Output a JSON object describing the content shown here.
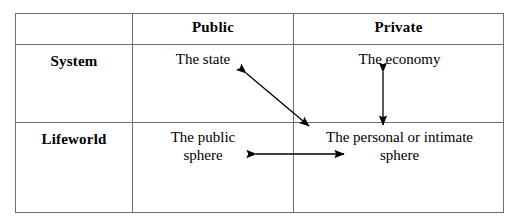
{
  "diagram": {
    "type": "2x2 matrix table",
    "title": "",
    "table": {
      "column_headers": [
        "",
        "Public",
        "Private"
      ],
      "row_labels": [
        "System",
        "Lifeworld"
      ],
      "rows": [
        {
          "label": "System",
          "cells": [
            "The state",
            "The economy"
          ]
        },
        {
          "label": "Lifeworld",
          "cells": [
            "The public sphere",
            "The personal or intimate sphere"
          ]
        }
      ],
      "cell_text": {
        "system_public": "The state",
        "system_private": "The economy",
        "lifeworld_public_line1": "The public",
        "lifeworld_public_line2": "sphere",
        "lifeworld_private_line1": "The personal or intimate",
        "lifeworld_private_line2": "sphere"
      }
    },
    "arrows": [
      {
        "name": "state-to-personal-sphere",
        "style": "double-headed diagonal",
        "from": "The state",
        "to": "The personal or intimate sphere"
      },
      {
        "name": "economy-to-personal-sphere",
        "style": "double-headed vertical",
        "from": "The economy",
        "to": "The personal or intimate sphere"
      },
      {
        "name": "public-sphere-to-personal-sphere",
        "style": "double-headed horizontal",
        "from": "The public sphere",
        "to": "The personal or intimate sphere"
      }
    ],
    "colors": {
      "background": "#ffffff",
      "text": "#000000",
      "border": "#6f6f6f",
      "arrow": "#000000"
    }
  }
}
